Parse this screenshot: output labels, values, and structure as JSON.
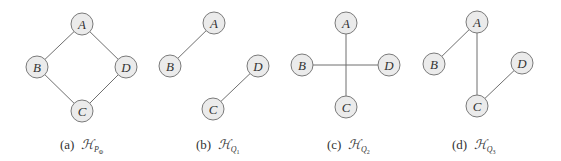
{
  "figure": {
    "style": {
      "node_fill": "#ebebeb",
      "node_stroke": "#7a7a7a",
      "edge_color": "#6f6f6f",
      "text_color": "#333333",
      "node_radius": 11
    },
    "panels": [
      {
        "id": "a",
        "caption_prefix": "(a)",
        "caption_symbol": "H",
        "caption_sub": "P",
        "caption_subsub": "Φ",
        "caption_x": 60,
        "nodes": [
          {
            "label": "A",
            "x": 82,
            "y": 24
          },
          {
            "label": "B",
            "x": 37,
            "y": 67
          },
          {
            "label": "D",
            "x": 126,
            "y": 67
          },
          {
            "label": "C",
            "x": 82,
            "y": 111
          }
        ],
        "edges": [
          [
            "A",
            "B"
          ],
          [
            "A",
            "D"
          ],
          [
            "B",
            "C"
          ],
          [
            "D",
            "C"
          ]
        ]
      },
      {
        "id": "b",
        "caption_prefix": "(b)",
        "caption_symbol": "H",
        "caption_sub": "Q",
        "caption_subsub": "1",
        "caption_x": 196,
        "nodes": [
          {
            "label": "A",
            "x": 214,
            "y": 23
          },
          {
            "label": "B",
            "x": 170,
            "y": 66
          },
          {
            "label": "D",
            "x": 258,
            "y": 66
          },
          {
            "label": "C",
            "x": 213,
            "y": 109
          }
        ],
        "edges": [
          [
            "A",
            "B"
          ],
          [
            "D",
            "C"
          ]
        ]
      },
      {
        "id": "c",
        "caption_prefix": "(c)",
        "caption_symbol": "H",
        "caption_sub": "Q",
        "caption_subsub": "2",
        "caption_x": 327,
        "nodes": [
          {
            "label": "A",
            "x": 346,
            "y": 23
          },
          {
            "label": "B",
            "x": 302,
            "y": 65
          },
          {
            "label": "D",
            "x": 389,
            "y": 65
          },
          {
            "label": "C",
            "x": 346,
            "y": 107
          }
        ],
        "edges": [
          [
            "A",
            "C"
          ],
          [
            "B",
            "D"
          ]
        ]
      },
      {
        "id": "d",
        "caption_prefix": "(d)",
        "caption_symbol": "H",
        "caption_sub": "Q",
        "caption_subsub": "3",
        "caption_x": 452,
        "nodes": [
          {
            "label": "A",
            "x": 477,
            "y": 22
          },
          {
            "label": "B",
            "x": 434,
            "y": 64
          },
          {
            "label": "D",
            "x": 522,
            "y": 63
          },
          {
            "label": "C",
            "x": 477,
            "y": 106
          }
        ],
        "edges": [
          [
            "A",
            "B"
          ],
          [
            "A",
            "C"
          ],
          [
            "D",
            "C"
          ]
        ]
      }
    ]
  }
}
